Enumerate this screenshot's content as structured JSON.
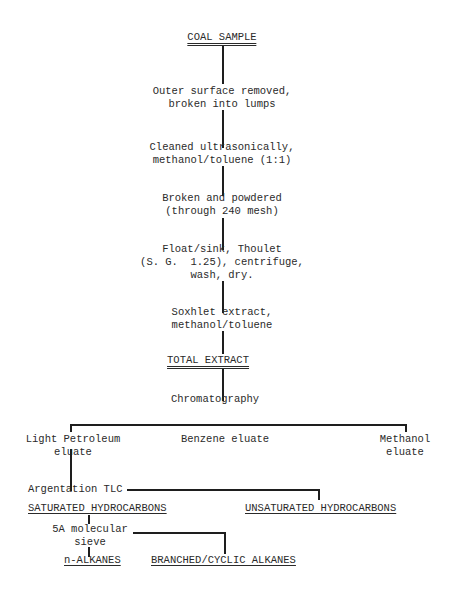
{
  "diagram": {
    "title": "COAL SAMPLE",
    "steps": [
      {
        "line1": "Outer surface removed,",
        "line2": "broken into lumps"
      },
      {
        "line1": "Cleaned ultrasonically,",
        "line2": "methanol/toluene (1:1)"
      },
      {
        "line1": "Broken and powdered",
        "line2": "(through 240 mesh)"
      },
      {
        "line1": "Float/sink, Thoulet",
        "line2": "(S. G.  1.25), centrifuge,",
        "line3": "wash, dry."
      },
      {
        "line1": "Soxhlet extract,",
        "line2": "methanol/toluene"
      }
    ],
    "total_extract": "TOTAL EXTRACT",
    "chromatography": "Chromatography",
    "eluates": {
      "light_petroleum": {
        "line1": "Light Petroleum",
        "line2": "eluate"
      },
      "benzene": "Benzene eluate",
      "methanol": {
        "line1": "Methanol",
        "line2": "eluate"
      }
    },
    "argentation": "Argentation TLC",
    "saturated": "SATURATED HYDROCARBONS",
    "unsaturated": "UNSATURATED HYDROCARBONS",
    "sieve": {
      "line1": "5A molecular",
      "line2": "sieve"
    },
    "n_alkanes": "n-ALKANES",
    "branched": "BRANCHED/CYCLIC ALKANES"
  }
}
